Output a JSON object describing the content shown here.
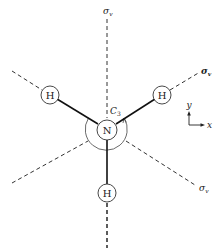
{
  "figure": {
    "molecule": "NH3",
    "center_atom": {
      "label": "N",
      "x": 107,
      "y": 130,
      "r": 10
    },
    "outer_arc_radius": 21,
    "hydrogens": [
      {
        "label": "H",
        "x": 50,
        "y": 95,
        "r": 9
      },
      {
        "label": "H",
        "x": 162,
        "y": 95,
        "r": 9
      },
      {
        "label": "H",
        "x": 107,
        "y": 193,
        "r": 9
      }
    ],
    "rotation_axis_label": "C",
    "rotation_axis_subscript": "3",
    "mirror_planes": [
      {
        "label": "σ",
        "subscript": "v",
        "lx": 103,
        "ly": 14
      },
      {
        "label": "σ",
        "subscript": "v",
        "lx": 201,
        "ly": 74
      },
      {
        "label": "σ",
        "subscript": "v",
        "lx": 199,
        "ly": 191
      }
    ],
    "axes": {
      "y_label": "y",
      "x_label": "x"
    },
    "colors": {
      "line": "#222222",
      "thin": "#444444",
      "background": "#ffffff"
    }
  }
}
